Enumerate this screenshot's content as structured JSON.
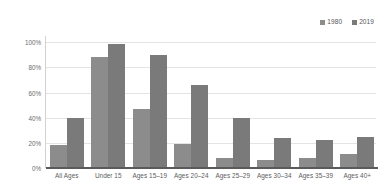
{
  "chart_data": {
    "type": "bar",
    "title": "",
    "xlabel": "",
    "ylabel": "",
    "categories": [
      "All Ages",
      "Under 15",
      "Ages 15–19",
      "Ages 20–24",
      "Ages 25–29",
      "Ages 30–34",
      "Ages 35–39",
      "Ages 40+"
    ],
    "series": [
      {
        "name": "1980",
        "color": "#8c8c8c",
        "values": [
          18,
          88,
          47,
          19,
          8,
          6,
          8,
          11
        ]
      },
      {
        "name": "2019",
        "color": "#7a7a7a",
        "values": [
          40,
          99,
          90,
          66,
          40,
          24,
          22,
          25
        ]
      }
    ],
    "ylim": [
      0,
      105
    ],
    "yticks": [
      0,
      20,
      40,
      60,
      80,
      100
    ],
    "ytick_labels": [
      "0%",
      "20%",
      "40%",
      "60%",
      "80%",
      "100%"
    ],
    "grid": true,
    "legend_position": "top-right",
    "value_suffix": "%"
  },
  "legend": {
    "entries": [
      {
        "label": "1980",
        "color": "#8c8c8c"
      },
      {
        "label": "2019",
        "color": "#7a7a7a"
      }
    ]
  },
  "colors": {
    "series_1980": "#8c8c8c",
    "series_2019": "#7a7a7a",
    "gridline": "#e4e4e4",
    "axis": "#5a5a5a",
    "text": "#5d5d5d",
    "background": "#ffffff"
  }
}
